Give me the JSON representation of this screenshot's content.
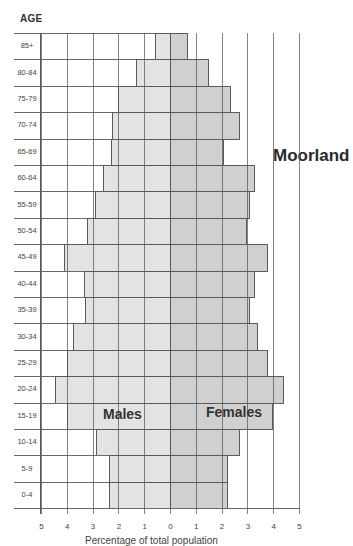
{
  "chart_data": {
    "type": "bar",
    "subtype": "population-pyramid",
    "title": "Moorland",
    "ylabel": "AGE",
    "xlabel": "Percentage of total population",
    "xlim": [
      -5,
      5
    ],
    "x_ticks": [
      5,
      4,
      3,
      2,
      1,
      0,
      1,
      2,
      3,
      4,
      5
    ],
    "grid": true,
    "categories": [
      "85+",
      "80-84",
      "75-79",
      "70-74",
      "65-69",
      "60-64",
      "55-59",
      "50-54",
      "45-49",
      "40-44",
      "35-39",
      "30-34",
      "25-29",
      "20-24",
      "15-19",
      "10-14",
      "5-9",
      "0-4"
    ],
    "series": [
      {
        "name": "Males",
        "color": "#e3e3e3",
        "values": [
          0.6,
          1.3,
          2.0,
          2.25,
          2.3,
          2.6,
          2.9,
          3.2,
          4.1,
          3.35,
          3.3,
          3.75,
          4.0,
          4.45,
          4.0,
          2.85,
          2.35,
          2.35
        ]
      },
      {
        "name": "Females",
        "color": "#d0d0d0",
        "values": [
          0.7,
          1.5,
          2.35,
          2.7,
          2.1,
          3.3,
          3.1,
          3.0,
          3.8,
          3.3,
          3.1,
          3.4,
          3.8,
          4.4,
          4.0,
          2.7,
          2.25,
          2.25
        ]
      }
    ]
  },
  "labels": {
    "age_title": "AGE",
    "place": "Moorland",
    "males": "Males",
    "females": "Females",
    "xlabel": "Percentage of total population"
  }
}
